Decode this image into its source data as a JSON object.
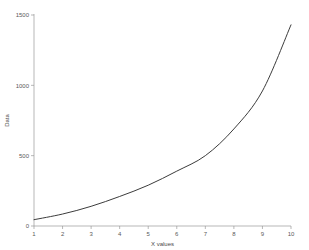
{
  "chart_data": {
    "type": "line",
    "title": "",
    "subtitle": "",
    "xlabel": "X values",
    "ylabel": "Data",
    "x": [
      1,
      2,
      3,
      4,
      5,
      6,
      7,
      8,
      9,
      10
    ],
    "values": [
      45,
      85,
      140,
      210,
      290,
      390,
      500,
      690,
      960,
      1430
    ],
    "series": [
      {
        "name": "Data",
        "values": [
          45,
          85,
          140,
          210,
          290,
          390,
          500,
          690,
          960,
          1430
        ]
      }
    ],
    "xlim": [
      1,
      10
    ],
    "ylim": [
      0,
      1500
    ],
    "xticks": [
      1,
      2,
      3,
      4,
      5,
      6,
      7,
      8,
      9,
      10
    ],
    "xticklabels": [
      "1",
      "2",
      "3",
      "4",
      "5",
      "6",
      "7",
      "8",
      "9",
      "10"
    ],
    "yticks": [
      0,
      500,
      1000,
      1500
    ],
    "yticklabels": [
      "0",
      "500",
      "1000",
      "1500"
    ],
    "grid": false,
    "legend": false,
    "legend_position": "none",
    "line_color": "#3c3c3c",
    "axis_color": "#9a9a9a",
    "tick_label_color": "#5a5a5a",
    "background_color": "#ffffff"
  }
}
